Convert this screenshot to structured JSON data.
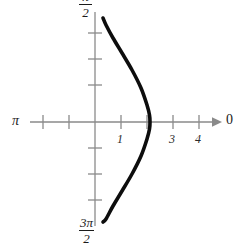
{
  "figure": {
    "width": 244,
    "height": 248,
    "background": "#ffffff",
    "axis_color": "#8a8a8a",
    "curve_color": "#0d0d0d",
    "text_color": "#1a1a1a"
  },
  "labels": {
    "x_left": "π",
    "x_right": "0",
    "y_top_numerator": "π",
    "y_top_denominator": "2",
    "y_bottom_numerator": "3π",
    "y_bottom_denominator": "2",
    "x_tick_1": "1",
    "x_tick_3": "3",
    "x_tick_4": "4"
  },
  "chart_data": {
    "type": "line",
    "title": "",
    "xlabel": "",
    "ylabel": "",
    "grid": false,
    "legend": null,
    "axis_style": "cartesian-cross-with-right-arrow",
    "xlim": [
      -2.5,
      4.8
    ],
    "ylim": [
      -3.9,
      4.2
    ],
    "x_axis": {
      "label_left": "π",
      "label_right": "0",
      "tick_values": [
        -2,
        -1,
        0,
        1,
        2,
        3,
        4
      ],
      "tick_labels": [
        "",
        "",
        "",
        "1",
        "",
        "3",
        "4"
      ],
      "tick_pixel_x": [
        43,
        69,
        95,
        121,
        147,
        173,
        199
      ],
      "arrow_at": "right"
    },
    "y_axis": {
      "label_top": "π/2",
      "label_bottom": "3π/2",
      "tick_values": [
        -3,
        -2,
        -1,
        0,
        1,
        2,
        3
      ],
      "tick_labels": [
        "",
        "",
        "",
        "",
        "",
        "",
        ""
      ],
      "tick_pixel_y": [
        200,
        174,
        148,
        122,
        85,
        59,
        33
      ]
    },
    "series": [
      {
        "name": "curve",
        "description": "rightward-bowing arc, symmetric about the x-axis",
        "x": [
          0.31,
          0.48,
          0.78,
          1.1,
          1.44,
          1.74,
          1.97,
          2.08,
          2.12,
          2.08,
          1.97,
          1.74,
          1.44,
          1.1,
          0.78,
          0.48,
          0.31
        ],
        "y": [
          4.0,
          3.73,
          3.23,
          2.65,
          1.99,
          1.31,
          0.66,
          0.26,
          0.0,
          -0.26,
          -0.66,
          -1.31,
          -1.99,
          -2.65,
          -3.23,
          -3.73,
          -4.0
        ],
        "pixel_points": [
          [
            103,
            18
          ],
          [
            106,
            25
          ],
          [
            113,
            38
          ],
          [
            122,
            53
          ],
          [
            132,
            70
          ],
          [
            141,
            88
          ],
          [
            147,
            105
          ],
          [
            149.5,
            115
          ],
          [
            150,
            122
          ],
          [
            149.5,
            129
          ],
          [
            147,
            139
          ],
          [
            141,
            156
          ],
          [
            132,
            174
          ],
          [
            122,
            191
          ],
          [
            113,
            206
          ],
          [
            106,
            219
          ],
          [
            103,
            222
          ]
        ],
        "stroke_width": 3.6,
        "color": "#0d0d0d"
      }
    ]
  }
}
